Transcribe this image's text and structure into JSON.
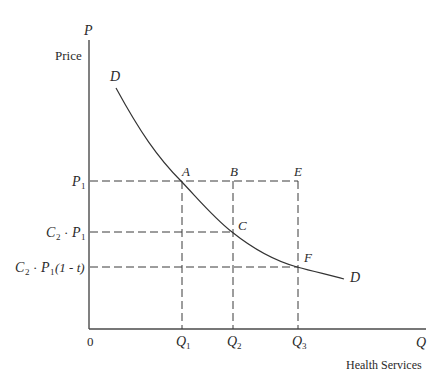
{
  "diagram": {
    "type": "demand_curve",
    "y_axis": {
      "symbol": "P",
      "label": "Price"
    },
    "x_axis": {
      "symbol": "Q",
      "label": "Health Services",
      "origin": "0"
    },
    "curve": {
      "start_label": "D",
      "end_label": "D"
    },
    "points": {
      "A": "A",
      "B": "B",
      "C": "C",
      "E": "E",
      "F": "F"
    },
    "y_ticks": {
      "p1": {
        "main": "P",
        "sub": "1"
      },
      "c2p1": {
        "c": "C",
        "c_sub": "2",
        "dot": "·",
        "p": "P",
        "p_sub": "1"
      },
      "c2p1t": {
        "c": "C",
        "c_sub": "2",
        "dot": "·",
        "p": "P",
        "p_sub": "1",
        "tail": "(1 - t)"
      }
    },
    "x_ticks": {
      "q1": {
        "main": "Q",
        "sub": "1"
      },
      "q2": {
        "main": "Q",
        "sub": "2"
      },
      "q3": {
        "main": "Q",
        "sub": "3"
      }
    }
  }
}
